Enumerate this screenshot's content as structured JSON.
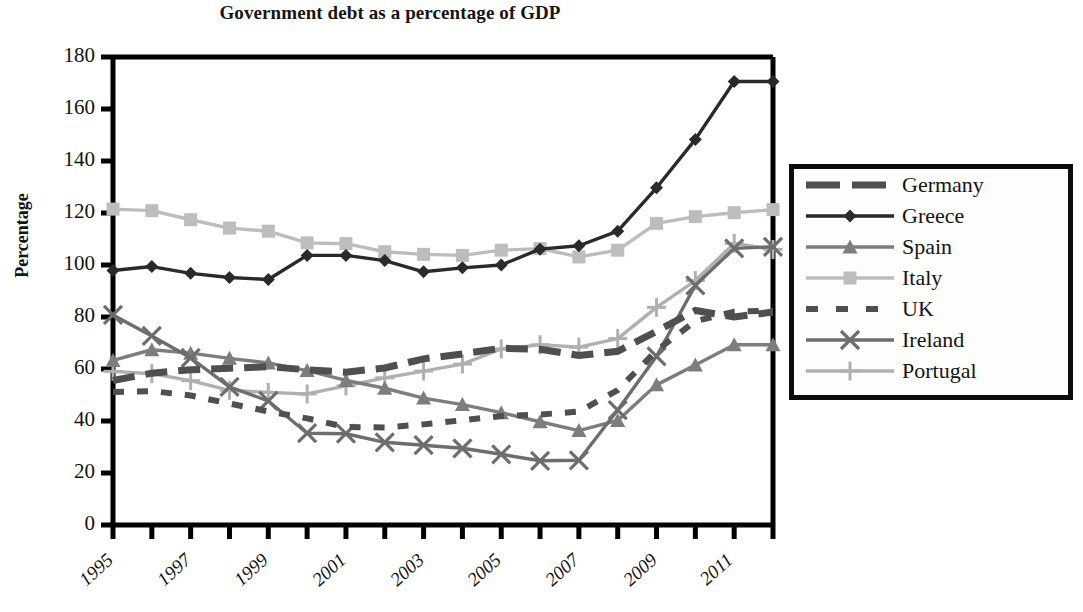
{
  "chart_data": {
    "type": "line",
    "title": "Government debt as a percentage of GDP",
    "xlabel": "",
    "ylabel": "Percentage",
    "ylim": [
      0,
      180
    ],
    "ytick_step": 20,
    "yticks": [
      "0",
      "20",
      "40",
      "60",
      "80",
      "100",
      "120",
      "140",
      "160",
      "180"
    ],
    "grid": false,
    "legend_position": "right-outside",
    "x": [
      1995,
      1996,
      1997,
      1998,
      1999,
      2000,
      2001,
      2002,
      2003,
      2004,
      2005,
      2006,
      2007,
      2008,
      2009,
      2010,
      2011,
      2012
    ],
    "xtick_labels": [
      "1995",
      "1997",
      "1999",
      "2001",
      "2003",
      "2005",
      "2007",
      "2009",
      "2011"
    ],
    "xtick_values": [
      1995,
      1997,
      1999,
      2001,
      2003,
      2005,
      2007,
      2009,
      2011
    ],
    "series": [
      {
        "name": "Germany",
        "marker": "none",
        "line": "thick-dashed",
        "color": "#4f4f4f",
        "values": [
          55.6,
          58.4,
          59.7,
          60.3,
          60.9,
          59.7,
          58.8,
          60.4,
          63.9,
          65.8,
          68.0,
          67.6,
          65.2,
          66.8,
          74.5,
          82.5,
          80.0,
          81.9
        ]
      },
      {
        "name": "Greece",
        "marker": "diamond",
        "line": "solid",
        "color": "#2a2a2a",
        "values": [
          97.9,
          99.4,
          96.8,
          95.2,
          94.4,
          103.7,
          103.7,
          101.7,
          97.4,
          98.9,
          100.0,
          106.1,
          107.4,
          113.0,
          129.7,
          148.3,
          170.6,
          170.6
        ]
      },
      {
        "name": "Spain",
        "marker": "triangle",
        "line": "solid",
        "color": "#7d7d7d",
        "values": [
          63.3,
          67.4,
          66.1,
          64.1,
          62.3,
          59.4,
          55.6,
          52.6,
          48.8,
          46.3,
          43.2,
          39.7,
          36.3,
          40.2,
          53.9,
          61.5,
          69.3,
          69.3
        ]
      },
      {
        "name": "Italy",
        "marker": "square",
        "line": "solid",
        "color": "#bdbdbd",
        "values": [
          121.5,
          120.9,
          117.4,
          114.2,
          113.0,
          108.5,
          108.2,
          105.1,
          104.1,
          103.7,
          105.7,
          106.3,
          103.1,
          105.7,
          116.0,
          118.6,
          120.1,
          121.3
        ]
      },
      {
        "name": "UK",
        "marker": "none",
        "line": "dotted",
        "color": "#4f4f4f",
        "values": [
          51.2,
          51.5,
          49.8,
          46.7,
          43.7,
          41.0,
          37.7,
          37.5,
          38.7,
          40.3,
          41.9,
          42.5,
          43.6,
          51.9,
          67.1,
          78.4,
          82.0,
          82.5
        ]
      },
      {
        "name": "Ireland",
        "marker": "x",
        "line": "solid",
        "color": "#6d6d6d",
        "values": [
          80.8,
          72.7,
          64.3,
          53.1,
          47.7,
          35.3,
          35.1,
          31.8,
          30.7,
          29.5,
          27.2,
          24.7,
          24.9,
          44.2,
          64.9,
          92.2,
          106.4,
          107.0
        ]
      },
      {
        "name": "Portugal",
        "marker": "plus",
        "line": "solid",
        "color": "#b0b0b0",
        "values": [
          59.1,
          58.2,
          55.5,
          51.8,
          51.0,
          50.4,
          53.5,
          56.6,
          59.2,
          61.9,
          67.7,
          69.3,
          68.4,
          71.7,
          83.7,
          94.0,
          108.3,
          106.0
        ]
      }
    ]
  },
  "legend": {
    "items": [
      {
        "label": "Germany",
        "marker": "none",
        "style": "thick-dashed",
        "color": "#4f4f4f"
      },
      {
        "label": "Greece",
        "marker": "diamond",
        "style": "solid",
        "color": "#2a2a2a"
      },
      {
        "label": "Spain",
        "marker": "triangle",
        "style": "solid",
        "color": "#7d7d7d"
      },
      {
        "label": "Italy",
        "marker": "square",
        "style": "solid",
        "color": "#bdbdbd"
      },
      {
        "label": "UK",
        "marker": "none",
        "style": "dotted",
        "color": "#4f4f4f"
      },
      {
        "label": "Ireland",
        "marker": "x",
        "style": "solid",
        "color": "#6d6d6d"
      },
      {
        "label": "Portugal",
        "marker": "plus",
        "style": "solid",
        "color": "#b0b0b0"
      }
    ]
  }
}
